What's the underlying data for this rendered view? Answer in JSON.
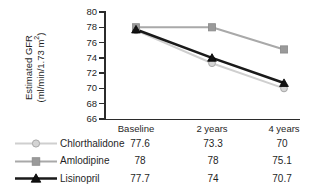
{
  "chart_data": {
    "type": "line",
    "title": "",
    "subtitle": "",
    "xlabel": "",
    "ylabel": "Estimated GFR (ml/min/1.73 m2)",
    "ylabel_line1": "Estimated GFR",
    "ylabel_line2_prefix": "(ml/min/1.73 m",
    "ylabel_line2_suffix": ")",
    "ylabel_superscript": "2",
    "categories": [
      "Baseline",
      "2 years",
      "4 years"
    ],
    "ylim": [
      66,
      80
    ],
    "yticks": [
      80,
      78,
      76,
      74,
      72,
      70,
      68,
      66
    ],
    "ytick_labels": [
      "80",
      "78",
      "76",
      "74",
      "72",
      "70",
      "68",
      "66"
    ],
    "grid": false,
    "legend_position": "bottom-table",
    "series": [
      {
        "name": "Chlorthalidone",
        "values": [
          77.6,
          73.3,
          70
        ],
        "value_labels": [
          "77.6",
          "73.3",
          "70"
        ],
        "marker": "circle",
        "color": "#c4c4c4",
        "line_color": "#cfcfcf",
        "marker_fill": "#d4d4d4",
        "marker_stroke": "#a8a8a8"
      },
      {
        "name": "Amlodipine",
        "values": [
          78,
          78,
          75.1
        ],
        "value_labels": [
          "78",
          "78",
          "75.1"
        ],
        "marker": "square",
        "color": "#9a9a9a",
        "line_color": "#a9a9a9",
        "marker_fill": "#9a9a9a",
        "marker_stroke": "#8a8a8a"
      },
      {
        "name": "Lisinopril",
        "values": [
          77.7,
          74,
          70.7
        ],
        "value_labels": [
          "77.7",
          "74",
          "70.7"
        ],
        "marker": "triangle",
        "color": "#1a1a1a",
        "line_color": "#1a1a1a",
        "marker_fill": "#121212",
        "marker_stroke": "#000000"
      }
    ]
  },
  "axis": {
    "line_color": "#2b2b2b"
  },
  "legend": {
    "columns": [
      "Baseline",
      "2 years",
      "4 years"
    ]
  }
}
